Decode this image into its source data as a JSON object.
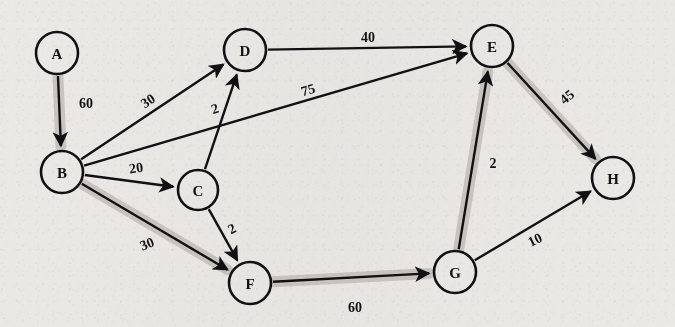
{
  "figure": {
    "kind": "directed-weighted-graph",
    "background_color": "#ebe9e6",
    "ink_color": "#111111",
    "highlight_color": "#c9c6c2",
    "width": 675,
    "height": 327
  },
  "nodes": [
    {
      "id": "A",
      "label": "A",
      "cx": 57,
      "cy": 53,
      "r": 21
    },
    {
      "id": "B",
      "label": "B",
      "cx": 62,
      "cy": 172,
      "r": 21
    },
    {
      "id": "C",
      "label": "C",
      "cx": 198,
      "cy": 190,
      "r": 20
    },
    {
      "id": "D",
      "label": "D",
      "cx": 245,
      "cy": 50,
      "r": 21
    },
    {
      "id": "E",
      "label": "E",
      "cx": 492,
      "cy": 46,
      "r": 21
    },
    {
      "id": "F",
      "label": "F",
      "cx": 250,
      "cy": 283,
      "r": 21
    },
    {
      "id": "G",
      "label": "G",
      "cx": 455,
      "cy": 272,
      "r": 21
    },
    {
      "id": "H",
      "label": "H",
      "cx": 613,
      "cy": 178,
      "r": 21
    }
  ],
  "edges": [
    {
      "id": "A-B",
      "from": "A",
      "to": "B",
      "weight": "60",
      "label_x": 86,
      "label_y": 103,
      "label_rotation": 0,
      "highlighted": true
    },
    {
      "id": "B-D",
      "from": "B",
      "to": "D",
      "weight": "30",
      "label_x": 148,
      "label_y": 101,
      "label_rotation": -34,
      "highlighted": false
    },
    {
      "id": "C-D",
      "from": "C",
      "to": "D",
      "weight": "2",
      "label_x": 215,
      "label_y": 109,
      "label_rotation": -18,
      "highlighted": false
    },
    {
      "id": "B-E",
      "from": "B",
      "to": "E",
      "weight": "75",
      "label_x": 308,
      "label_y": 90,
      "label_rotation": -15,
      "highlighted": false
    },
    {
      "id": "B-C",
      "from": "B",
      "to": "C",
      "weight": "20",
      "label_x": 136,
      "label_y": 168,
      "label_rotation": -8,
      "highlighted": false
    },
    {
      "id": "B-F",
      "from": "B",
      "to": "F",
      "weight": "30",
      "label_x": 147,
      "label_y": 244,
      "label_rotation": -22,
      "highlighted": true
    },
    {
      "id": "C-F",
      "from": "C",
      "to": "F",
      "weight": "2",
      "label_x": 232,
      "label_y": 229,
      "label_rotation": -28,
      "highlighted": false
    },
    {
      "id": "D-E",
      "from": "D",
      "to": "E",
      "weight": "40",
      "label_x": 368,
      "label_y": 37,
      "label_rotation": 0,
      "highlighted": false
    },
    {
      "id": "E-H",
      "from": "E",
      "to": "H",
      "weight": "45",
      "label_x": 567,
      "label_y": 97,
      "label_rotation": -40,
      "highlighted": true
    },
    {
      "id": "G-E",
      "from": "G",
      "to": "E",
      "weight": "2",
      "label_x": 493,
      "label_y": 163,
      "label_rotation": 0,
      "highlighted": true
    },
    {
      "id": "F-G",
      "from": "F",
      "to": "G",
      "weight": "60",
      "label_x": 355,
      "label_y": 307,
      "label_rotation": 0,
      "highlighted": true
    },
    {
      "id": "G-H",
      "from": "G",
      "to": "H",
      "weight": "10",
      "label_x": 535,
      "label_y": 240,
      "label_rotation": -26,
      "highlighted": false
    }
  ],
  "highlighted_path": [
    "A",
    "B",
    "F",
    "G",
    "E",
    "H"
  ]
}
